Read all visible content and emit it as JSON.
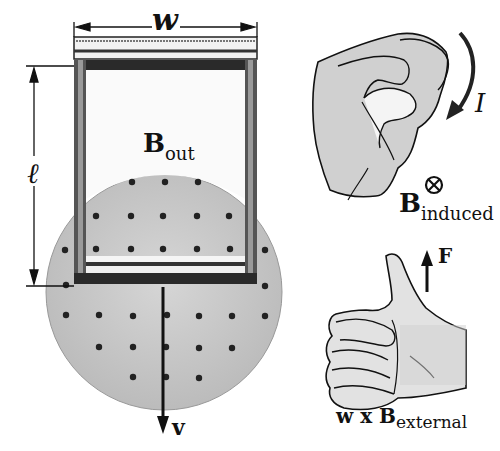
{
  "diagram": {
    "labels": {
      "width": "w",
      "length": "ℓ",
      "b_out_main": "B",
      "b_out_sub": "out",
      "velocity": "v",
      "current": "I",
      "b_induced_main": "B",
      "b_induced_sub": "induced",
      "force": "F",
      "cross_product_prefix": "w x B",
      "cross_product_sub": "external",
      "into_page_symbol": "⊗"
    },
    "field": {
      "direction": "out of page",
      "marker": "dot",
      "region_shape": "circle",
      "region_color": "#c8c8c8"
    },
    "elements": [
      {
        "name": "conducting-loop",
        "desc": "rectangular frame of width w and length ℓ"
      },
      {
        "name": "sliding-bar",
        "desc": "bar at top of loop"
      },
      {
        "name": "magnetic-field-region",
        "desc": "circular shaded region with dots (B out)"
      },
      {
        "name": "velocity-arrow",
        "desc": "downward arrow labeled v"
      },
      {
        "name": "curled-hand",
        "desc": "right-hand rule for current I giving B induced into page"
      },
      {
        "name": "thumbs-up-hand",
        "desc": "right-hand rule: w x B external gives F upward"
      }
    ],
    "colors": {
      "ink": "#111111",
      "field_fill": "#c8c8c8",
      "hand_shade": "#d4d4d4",
      "background": "#ffffff"
    }
  }
}
